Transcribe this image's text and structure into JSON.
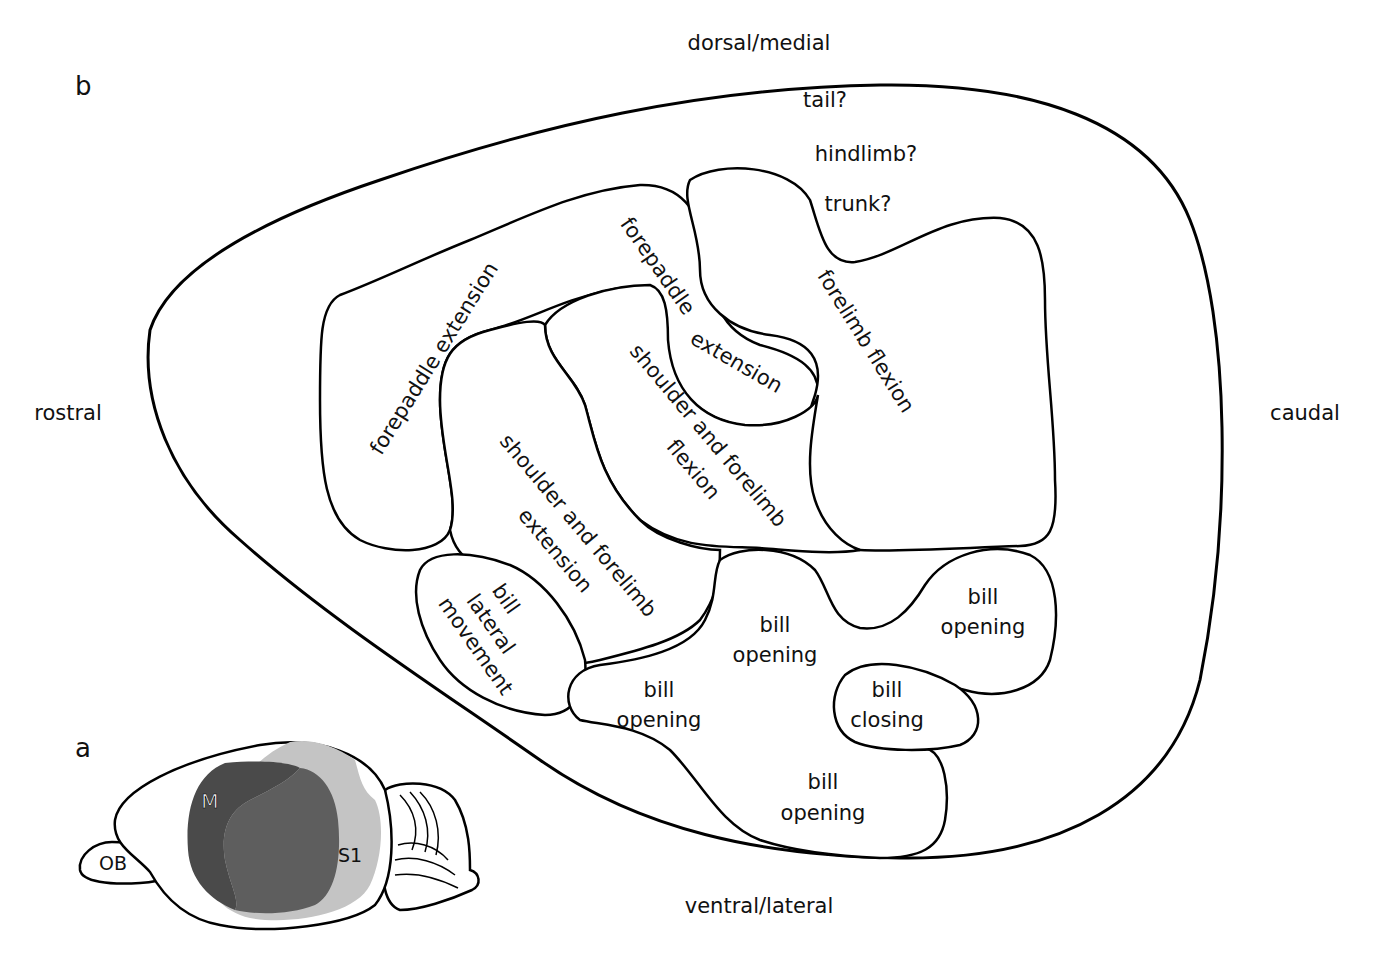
{
  "panels": {
    "a": "a",
    "b": "b"
  },
  "orientation": {
    "top": "dorsal/medial",
    "bottom": "ventral/lateral",
    "left": "rostral",
    "right": "caudal"
  },
  "uncertain_regions": {
    "tail": "tail?",
    "hindlimb": "hindlimb?",
    "trunk": "trunk?"
  },
  "regions": {
    "forepaddle_extension_rostral": "forepaddle extension",
    "forepaddle_extension_mid_line1": "forepaddle",
    "forepaddle_extension_mid_line2": "extension",
    "forelimb_flexion": "forelimb  flexion",
    "shoulder_forelimb_flexion_line1": "shoulder and forelimb",
    "shoulder_forelimb_flexion_line2": "flexion",
    "shoulder_forelimb_extension_line1": "shoulder and forelimb",
    "shoulder_forelimb_extension_line2": "extension",
    "bill_lateral_line1": "bill",
    "bill_lateral_line2": "lateral",
    "bill_lateral_line3": "movement",
    "bill_opening_center_line1": "bill",
    "bill_opening_center_line2": "opening",
    "bill_opening_right_line1": "bill",
    "bill_opening_right_line2": "opening",
    "bill_opening_left_line1": "bill",
    "bill_opening_left_line2": "opening",
    "bill_closing_line1": "bill",
    "bill_closing_line2": "closing",
    "bill_opening_bottom_line1": "bill",
    "bill_opening_bottom_line2": "opening"
  },
  "brain_inset": {
    "olfactory_bulb": "OB",
    "motor_cortex": "M",
    "somatosensory_cortex": "S1",
    "colors": {
      "motor": "#4a4a4a",
      "overlap": "#5e5e5e",
      "s1": "#c4c4c4"
    }
  }
}
